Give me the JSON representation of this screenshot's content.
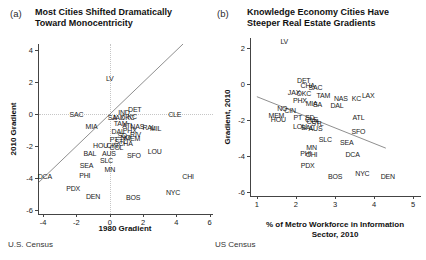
{
  "figure": {
    "panels": [
      {
        "tag": "(a)",
        "title": "Most Cities Shifted Dramatically\nToward Monocentricity",
        "source": "U.S. Census"
      },
      {
        "tag": "(b)",
        "title": "Knowledge Economy Cities Have\nSteeper Real Estate Gradients",
        "source": "US Census"
      }
    ]
  },
  "colors": {
    "text": "#1a1a1a",
    "trend_line": "#8f8f8f",
    "reference_dotted": "#c6c6c6",
    "background": "#ffffff"
  },
  "chart_data": [
    {
      "type": "scatter",
      "panel": "a",
      "title": "Most Cities Shifted Dramatically Toward Monocentricity",
      "xlabel": "1980 Gradient",
      "ylabel": "2010 Gradient",
      "source": "U.S. Census",
      "marker": "city-abbreviation-text",
      "xlim": [
        -4.25,
        6.2
      ],
      "ylim": [
        -6.25,
        4.4
      ],
      "xticks": [
        -4,
        -2,
        0,
        2,
        4,
        6
      ],
      "yticks": [
        4,
        2,
        0,
        -2,
        -4,
        -6
      ],
      "ref_x": 0,
      "ref_y": 0,
      "lines": [
        {
          "name": "45-degree-identity-line",
          "from": [
            -4.25,
            -4.25
          ],
          "to": [
            4.4,
            4.4
          ]
        }
      ],
      "points": [
        {
          "city": "LV",
          "x": 0.0,
          "y": 2.3
        },
        {
          "city": "SAC",
          "x": -2.0,
          "y": 0.0
        },
        {
          "city": "IND",
          "x": 0.85,
          "y": 0.15
        },
        {
          "city": "DET",
          "x": 1.5,
          "y": 0.3
        },
        {
          "city": "CLE",
          "x": 3.9,
          "y": 0.0
        },
        {
          "city": "SA",
          "x": 0.15,
          "y": -0.15
        },
        {
          "city": "JAX",
          "x": 0.5,
          "y": -0.2
        },
        {
          "city": "OKC",
          "x": 1.05,
          "y": -0.2
        },
        {
          "city": "KC",
          "x": 1.35,
          "y": -0.1
        },
        {
          "city": "MIA",
          "x": -1.1,
          "y": -0.75
        },
        {
          "city": "TAM",
          "x": 0.65,
          "y": -0.55
        },
        {
          "city": "ATL",
          "x": 1.1,
          "y": -0.65
        },
        {
          "city": "NAS",
          "x": 1.65,
          "y": -0.75
        },
        {
          "city": "RAL",
          "x": 2.35,
          "y": -0.8
        },
        {
          "city": "MIL",
          "x": 2.75,
          "y": -0.85
        },
        {
          "city": "DAL",
          "x": 0.5,
          "y": -1.05
        },
        {
          "city": "PHX",
          "x": 1.2,
          "y": -1.0
        },
        {
          "city": "SD",
          "x": 0.75,
          "y": -1.3
        },
        {
          "city": "RIV",
          "x": 1.55,
          "y": -1.25
        },
        {
          "city": "NO",
          "x": 0.95,
          "y": -1.45
        },
        {
          "city": "MEM",
          "x": 1.35,
          "y": -1.5
        },
        {
          "city": "PT",
          "x": 0.25,
          "y": -1.55
        },
        {
          "city": "STL",
          "x": 0.65,
          "y": -1.65
        },
        {
          "city": "CHA",
          "x": 0.95,
          "y": -1.8
        },
        {
          "city": "HOU",
          "x": -0.55,
          "y": -1.9
        },
        {
          "city": "CIN",
          "x": 0.15,
          "y": -1.95
        },
        {
          "city": "COL",
          "x": 0.4,
          "y": -2.05
        },
        {
          "city": "BAL",
          "x": -1.2,
          "y": -2.4
        },
        {
          "city": "AUS",
          "x": -0.05,
          "y": -2.4
        },
        {
          "city": "SLC",
          "x": -0.2,
          "y": -2.85
        },
        {
          "city": "SFO",
          "x": 1.45,
          "y": -2.55
        },
        {
          "city": "LOU",
          "x": 2.7,
          "y": -2.3
        },
        {
          "city": "SEA",
          "x": -1.4,
          "y": -3.2
        },
        {
          "city": "MN",
          "x": 0.0,
          "y": -3.45
        },
        {
          "city": "PHI",
          "x": -1.5,
          "y": -3.8
        },
        {
          "city": "DCA",
          "x": -3.9,
          "y": -3.9
        },
        {
          "city": "PDX",
          "x": -2.2,
          "y": -4.6
        },
        {
          "city": "DEN",
          "x": -1.0,
          "y": -5.15
        },
        {
          "city": "BOS",
          "x": 1.4,
          "y": -5.2
        },
        {
          "city": "NYC",
          "x": 3.8,
          "y": -4.85
        },
        {
          "city": "CHI",
          "x": 4.7,
          "y": -3.85
        }
      ]
    },
    {
      "type": "scatter",
      "panel": "b",
      "title": "Knowledge Economy Cities Have Steeper Real Estate Gradients",
      "xlabel": "% of Metro Workforce in Information\nSector, 2010",
      "ylabel": "Gradient, 2010",
      "source": "US Census",
      "marker": "city-abbreviation-text",
      "xlim": [
        0.85,
        5.2
      ],
      "ylim": [
        -6.2,
        2.55
      ],
      "xticks": [
        1,
        2,
        3,
        4,
        5
      ],
      "yticks": [
        2,
        0,
        -2,
        -4,
        -6
      ],
      "lines": [
        {
          "name": "downward-trend-line",
          "from": [
            1.0,
            -0.7
          ],
          "to": [
            4.3,
            -3.55
          ]
        }
      ],
      "points": [
        {
          "city": "LV",
          "x": 1.7,
          "y": 2.4
        },
        {
          "city": "DET",
          "x": 2.2,
          "y": 0.2
        },
        {
          "city": "CHA",
          "x": 2.3,
          "y": -0.05
        },
        {
          "city": "SAC",
          "x": 2.5,
          "y": -0.15
        },
        {
          "city": "JAX",
          "x": 1.95,
          "y": -0.45
        },
        {
          "city": "OKC",
          "x": 2.2,
          "y": -0.5
        },
        {
          "city": "TAM",
          "x": 2.7,
          "y": -0.6
        },
        {
          "city": "NAS",
          "x": 3.15,
          "y": -0.8
        },
        {
          "city": "KC",
          "x": 3.55,
          "y": -0.75
        },
        {
          "city": "LAX",
          "x": 3.85,
          "y": -0.6
        },
        {
          "city": "PHX",
          "x": 2.1,
          "y": -0.9
        },
        {
          "city": "MIA",
          "x": 2.4,
          "y": -1.05
        },
        {
          "city": "SA",
          "x": 2.55,
          "y": -1.1
        },
        {
          "city": "DAL",
          "x": 3.05,
          "y": -1.15
        },
        {
          "city": "NO",
          "x": 1.65,
          "y": -1.3
        },
        {
          "city": "CIN",
          "x": 1.85,
          "y": -1.45
        },
        {
          "city": "MEM",
          "x": 1.5,
          "y": -1.7
        },
        {
          "city": "HOU",
          "x": 1.55,
          "y": -1.95
        },
        {
          "city": "PT",
          "x": 2.05,
          "y": -1.85
        },
        {
          "city": "SD",
          "x": 2.35,
          "y": -1.8
        },
        {
          "city": "CLE",
          "x": 2.4,
          "y": -1.95
        },
        {
          "city": "COL",
          "x": 2.45,
          "y": -2.05
        },
        {
          "city": "STL",
          "x": 2.55,
          "y": -2.15
        },
        {
          "city": "ATL",
          "x": 3.6,
          "y": -1.85
        },
        {
          "city": "LOU",
          "x": 2.1,
          "y": -2.35
        },
        {
          "city": "BAL",
          "x": 2.3,
          "y": -2.4
        },
        {
          "city": "AUS",
          "x": 2.5,
          "y": -2.45
        },
        {
          "city": "SLC",
          "x": 2.75,
          "y": -3.05
        },
        {
          "city": "SFO",
          "x": 3.6,
          "y": -2.6
        },
        {
          "city": "SEA",
          "x": 3.3,
          "y": -3.2
        },
        {
          "city": "MN",
          "x": 2.4,
          "y": -3.5
        },
        {
          "city": "PHI",
          "x": 2.25,
          "y": -3.8
        },
        {
          "city": "CHI",
          "x": 2.4,
          "y": -3.85
        },
        {
          "city": "DCA",
          "x": 3.45,
          "y": -3.9
        },
        {
          "city": "PDX",
          "x": 2.3,
          "y": -4.5
        },
        {
          "city": "BOS",
          "x": 3.0,
          "y": -5.1
        },
        {
          "city": "NYC",
          "x": 3.7,
          "y": -4.9
        },
        {
          "city": "DEN",
          "x": 4.35,
          "y": -5.1
        }
      ]
    }
  ]
}
